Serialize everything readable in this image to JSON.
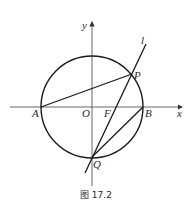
{
  "figure": {
    "caption": "图 17.2",
    "labels": {
      "x_axis": "x",
      "y_axis": "y",
      "origin": "O",
      "A": "A",
      "B": "B",
      "P": "P",
      "Q": "Q",
      "F": "F",
      "line": "l"
    },
    "stroke_color": "#1a1a1a",
    "axis_color": "#555555"
  }
}
